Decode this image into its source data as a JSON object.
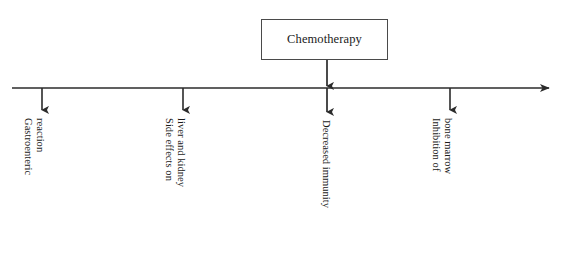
{
  "diagram": {
    "type": "flow-diagram",
    "source": {
      "label": "Chemotherapy",
      "box": {
        "x": 261,
        "y": 19,
        "width": 127,
        "height": 41
      }
    },
    "axis": {
      "orientation": "horizontal",
      "y": 88,
      "x_start": 12,
      "x_end": 557,
      "arrowhead": "right",
      "color": "#2b2b2b",
      "thickness": 1.6
    },
    "connector": {
      "description": "vertical arrow from Chemotherapy box down through the axis",
      "x": 327,
      "y_start": 60,
      "y_axis": 88,
      "y_end": 114,
      "arrowheads": [
        "at-axis",
        "at-end"
      ]
    },
    "branches": [
      {
        "id": "gastroenteric-reaction",
        "arrow": {
          "x": 42,
          "y_start": 88,
          "y_end": 112
        },
        "label_lines": [
          "Gastroenteric",
          "reaction"
        ],
        "label_origin": {
          "x": 46,
          "y": 118
        },
        "rotation_deg": 90
      },
      {
        "id": "side-effects-liver-kidney",
        "arrow": {
          "x": 183,
          "y_start": 88,
          "y_end": 112
        },
        "label_lines": [
          "Side effects on",
          "liver and kidney"
        ],
        "label_origin": {
          "x": 187,
          "y": 118
        },
        "rotation_deg": 90
      },
      {
        "id": "decreased-immunity",
        "arrow": {
          "x": 327,
          "y_start": 88,
          "y_end": 114
        },
        "label_lines": [
          "Decreased immunity"
        ],
        "label_origin": {
          "x": 331,
          "y": 120
        },
        "rotation_deg": 90
      },
      {
        "id": "inhibition-of-bone-marrow",
        "arrow": {
          "x": 450,
          "y_start": 88,
          "y_end": 112
        },
        "label_lines": [
          "Inhibition of",
          "bone marrow"
        ],
        "label_origin": {
          "x": 454,
          "y": 118
        },
        "rotation_deg": 90
      }
    ],
    "colors": {
      "ink": "#1a1a1a",
      "line": "#2b2b2b",
      "box_border": "#4a4a4a",
      "background": "#ffffff"
    }
  }
}
